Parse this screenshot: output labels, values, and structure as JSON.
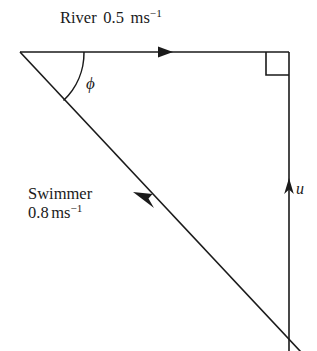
{
  "diagram": {
    "background_color": "#ffffff",
    "line_color": "#1a1a1a",
    "labels": {
      "river": {
        "name": "River",
        "value": "0.5",
        "unit_base": "ms",
        "unit_exponent": "−1",
        "full_text": "River 0.5 ms−1"
      },
      "swimmer": {
        "name": "Swimmer",
        "value": "0.8",
        "unit_base": "ms",
        "unit_exponent": "−1",
        "full_text": "Swimmer 0.8 ms−1"
      },
      "angle": {
        "symbol": "ϕ",
        "description": "angle between river direction and swimmer heading"
      },
      "resultant": {
        "symbol": "u",
        "description": "resultant velocity across the river"
      }
    },
    "markers": {
      "right_angle": "right-angle-square",
      "river_arrow_direction": "right",
      "swimmer_arrow_direction": "up-left",
      "resultant_arrow_direction": "up"
    },
    "geometry": {
      "apex": [
        20,
        52
      ],
      "top_right_corner": [
        289,
        52
      ],
      "river_line": [
        [
          20,
          52
        ],
        [
          289,
          52
        ]
      ],
      "resultant_line": [
        [
          289,
          52
        ],
        [
          289,
          351
        ]
      ],
      "swimmer_line": [
        [
          20,
          52
        ],
        [
          300,
          351
        ]
      ],
      "arc_start": [
        84,
        52
      ],
      "arc_end": [
        64,
        101
      ]
    }
  }
}
